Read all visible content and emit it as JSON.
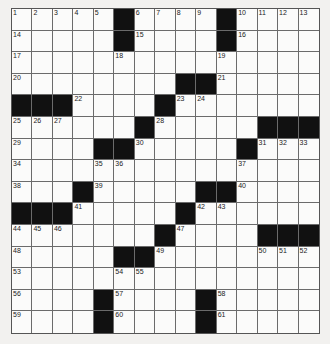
{
  "puzzle": {
    "size": 15,
    "rows": [
      "_____#____#____",
      "_____#____#____",
      "_______________",
      "________##_____",
      "###____#_______",
      "______#_____###",
      "____##_____#___",
      "_______________",
      "___#_____##____",
      "###_____#______",
      "_______#____###",
      "_____##________",
      "_______________",
      "____#____#_____",
      "____#____#_____"
    ],
    "numbers": [
      [
        0,
        0,
        "1"
      ],
      [
        0,
        1,
        "2"
      ],
      [
        0,
        2,
        "3"
      ],
      [
        0,
        3,
        "4"
      ],
      [
        0,
        4,
        "5"
      ],
      [
        0,
        6,
        "6"
      ],
      [
        0,
        7,
        "7"
      ],
      [
        0,
        8,
        "8"
      ],
      [
        0,
        9,
        "9"
      ],
      [
        0,
        11,
        "10"
      ],
      [
        0,
        12,
        "11"
      ],
      [
        0,
        13,
        "12"
      ],
      [
        0,
        14,
        "13"
      ],
      [
        1,
        0,
        "14"
      ],
      [
        1,
        6,
        "15"
      ],
      [
        1,
        11,
        "16"
      ],
      [
        2,
        0,
        "17"
      ],
      [
        2,
        5,
        "18"
      ],
      [
        2,
        10,
        "19"
      ],
      [
        3,
        0,
        "20"
      ],
      [
        3,
        10,
        "21"
      ],
      [
        4,
        3,
        "22"
      ],
      [
        4,
        8,
        "23"
      ],
      [
        4,
        9,
        "24"
      ],
      [
        5,
        0,
        "25"
      ],
      [
        5,
        1,
        "26"
      ],
      [
        5,
        2,
        "27"
      ],
      [
        5,
        7,
        "28"
      ],
      [
        6,
        0,
        "29"
      ],
      [
        6,
        6,
        "30"
      ],
      [
        6,
        12,
        "31"
      ],
      [
        6,
        13,
        "32"
      ],
      [
        6,
        14,
        "33"
      ],
      [
        7,
        0,
        "34"
      ],
      [
        7,
        4,
        "35"
      ],
      [
        7,
        5,
        "36"
      ],
      [
        7,
        11,
        "37"
      ],
      [
        8,
        0,
        "38"
      ],
      [
        8,
        4,
        "39"
      ],
      [
        8,
        11,
        "40"
      ],
      [
        9,
        3,
        "41"
      ],
      [
        9,
        9,
        "42"
      ],
      [
        9,
        10,
        "43"
      ],
      [
        10,
        0,
        "44"
      ],
      [
        10,
        1,
        "45"
      ],
      [
        10,
        2,
        "46"
      ],
      [
        10,
        8,
        "47"
      ],
      [
        11,
        0,
        "48"
      ],
      [
        11,
        7,
        "49"
      ],
      [
        11,
        12,
        "50"
      ],
      [
        11,
        13,
        "51"
      ],
      [
        11,
        14,
        "52"
      ],
      [
        12,
        0,
        "53"
      ],
      [
        12,
        5,
        "54"
      ],
      [
        12,
        6,
        "55"
      ],
      [
        13,
        0,
        "56"
      ],
      [
        13,
        5,
        "57"
      ],
      [
        13,
        10,
        "58"
      ],
      [
        14,
        0,
        "59"
      ],
      [
        14,
        5,
        "60"
      ],
      [
        14,
        10,
        "61"
      ]
    ]
  }
}
